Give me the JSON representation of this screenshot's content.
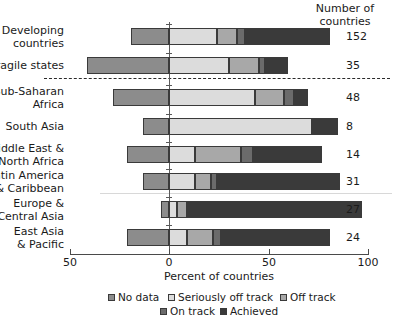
{
  "header": {
    "count_header": "Number of\ncountries"
  },
  "axis": {
    "title": "Percent of countries",
    "ticks": [
      {
        "value": -50,
        "label": "50",
        "px": 70
      },
      {
        "value": 0,
        "label": "0",
        "px": 169
      },
      {
        "value": 50,
        "label": "50",
        "px": 269
      },
      {
        "value": 100,
        "label": "100",
        "px": 368
      }
    ]
  },
  "legend": {
    "row1": [
      {
        "label": "No data",
        "color": "#8c8c8c"
      },
      {
        "label": "Seriously off track",
        "color": "#dcdcdc"
      },
      {
        "label": "Off track",
        "color": "#a8a8a8"
      }
    ],
    "row2": [
      {
        "label": "On track",
        "color": "#6b6b6b"
      },
      {
        "label": "Achieved",
        "color": "#3a3a3a"
      }
    ]
  },
  "colors": {
    "no_data": "#8c8c8c",
    "seriously_off_track": "#dcdcdc",
    "off_track": "#a8a8a8",
    "on_track": "#6b6b6b",
    "achieved": "#3a3a3a",
    "axis": "#4a4a4a",
    "text": "#1a1a1a"
  },
  "chart_data": {
    "type": "bar",
    "orientation": "horizontal",
    "stacked": true,
    "title": "",
    "xlabel": "Percent of countries",
    "ylabel": "",
    "xlim": [
      -50,
      100
    ],
    "grid": false,
    "legend_position": "bottom",
    "series": [
      {
        "name": "No data",
        "color": "#8c8c8c"
      },
      {
        "name": "Seriously off track",
        "color": "#dcdcdc"
      },
      {
        "name": "Off track",
        "color": "#a8a8a8"
      },
      {
        "name": "On track",
        "color": "#6b6b6b"
      },
      {
        "name": "Achieved",
        "color": "#3a3a3a"
      }
    ],
    "categories": [
      "Developing\ncountries",
      "Fragile states",
      "Sub-Saharan\nAfrica",
      "South Asia",
      "Middle East &\nNorth Africa",
      "Latin America\n& Caribbean",
      "Europe &\nCentral Asia",
      "East Asia\n& Pacific"
    ],
    "counts": [
      "152",
      "35",
      "48",
      "8",
      "14",
      "31",
      "27",
      "24"
    ],
    "rows": [
      {
        "category": "Developing\ncountries",
        "count": "152",
        "no_data": 19,
        "seriously_off_track": 24,
        "off_track": 10,
        "on_track": 4,
        "achieved": 43,
        "y_px": 28,
        "label_y_px": 25
      },
      {
        "category": "Fragile states",
        "count": "35",
        "no_data": 41,
        "seriously_off_track": 30,
        "off_track": 15,
        "on_track": 3,
        "achieved": 12,
        "y_px": 57,
        "label_y_px": 60
      },
      {
        "category": "Sub-Saharan\nAfrica",
        "count": "48",
        "no_data": 28,
        "seriously_off_track": 43,
        "off_track": 15,
        "on_track": 5,
        "achieved": 7,
        "y_px": 89,
        "label_y_px": 86
      },
      {
        "category": "South Asia",
        "count": "8",
        "no_data": 13,
        "seriously_off_track": 72,
        "off_track": 0,
        "on_track": 0,
        "achieved": 13,
        "y_px": 118,
        "label_y_px": 121
      },
      {
        "category": "Middle East &\nNorth Africa",
        "count": "14",
        "no_data": 21,
        "seriously_off_track": 13,
        "off_track": 23,
        "on_track": 6,
        "achieved": 35,
        "y_px": 146,
        "label_y_px": 143
      },
      {
        "category": "Latin America\n& Caribbean",
        "count": "31",
        "no_data": 13,
        "seriously_off_track": 13,
        "off_track": 8,
        "on_track": 3,
        "achieved": 62,
        "y_px": 173,
        "label_y_px": 170
      },
      {
        "category": "Europe &\nCentral Asia",
        "count": "27",
        "no_data": 4,
        "seriously_off_track": 4,
        "off_track": 5,
        "on_track": 0,
        "achieved": 88,
        "y_px": 201,
        "label_y_px": 198
      },
      {
        "category": "East Asia\n& Pacific",
        "count": "24",
        "no_data": 21,
        "seriously_off_track": 9,
        "off_track": 13,
        "on_track": 4,
        "achieved": 55,
        "y_px": 229,
        "label_y_px": 226
      }
    ]
  }
}
